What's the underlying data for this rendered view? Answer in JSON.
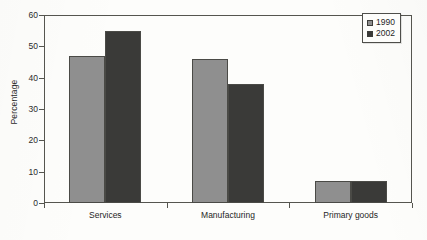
{
  "chart_data": {
    "type": "bar",
    "title": "",
    "subtitle": "",
    "xlabel": "",
    "ylabel": "Percentage",
    "categories": [
      "Services",
      "Manufacturing",
      "Primary goods"
    ],
    "series": [
      {
        "name": "1990",
        "color": "#8f8f8f",
        "values": [
          47,
          46,
          7
        ]
      },
      {
        "name": "2002",
        "color": "#3a3a38",
        "values": [
          55,
          38,
          7
        ]
      }
    ],
    "ylim": [
      0,
      60
    ],
    "ytick_values": [
      0,
      10,
      20,
      30,
      40,
      50,
      60
    ],
    "ytick_labels": [
      "0",
      "10",
      "20",
      "30",
      "40",
      "50",
      "60"
    ],
    "grid": false,
    "legend_position": "top-right",
    "legend_entries": [
      "1990",
      "2002"
    ],
    "annotations": []
  },
  "colors": {
    "series_1990": "#8f8f8f",
    "series_2002": "#3a3a38",
    "axis": "#55554f",
    "text": "#1f1f1f",
    "background": "#fdfdfb"
  }
}
